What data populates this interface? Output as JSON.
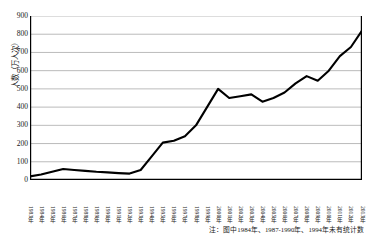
{
  "chart_data": {
    "type": "line",
    "title": "",
    "xlabel": "",
    "ylabel": "人数（万人次）",
    "ylim": [
      0,
      900
    ],
    "ytick_step": 100,
    "yticks": [
      "0",
      "100",
      "200",
      "300",
      "400",
      "500",
      "600",
      "700",
      "800",
      "900"
    ],
    "grid": true,
    "legend": "none",
    "line_color": "#000000",
    "grid_color": "#a9a9a9",
    "axis_color": "#000000",
    "categories": [
      "1983年",
      "1984年",
      "1985年",
      "1986年",
      "1987年",
      "1988年",
      "1989年",
      "1990年",
      "1991年",
      "1992年",
      "1993年",
      "1994年",
      "1995年",
      "1996年",
      "1997年",
      "1998年",
      "1999年",
      "2000年",
      "2001年",
      "2002年",
      "2003年",
      "2004年",
      "2005年",
      "2006年",
      "2007年",
      "2008年",
      "2009年",
      "2010年",
      "2011年",
      "2012年",
      "2013年"
    ],
    "values": [
      20,
      30,
      45,
      60,
      55,
      50,
      45,
      42,
      38,
      35,
      55,
      130,
      205,
      215,
      240,
      300,
      400,
      500,
      450,
      460,
      470,
      430,
      450,
      480,
      530,
      570,
      545,
      600,
      680,
      730,
      820
    ],
    "annotation": "注：图中1984年、1987-1990年、1994年未有统计数"
  }
}
